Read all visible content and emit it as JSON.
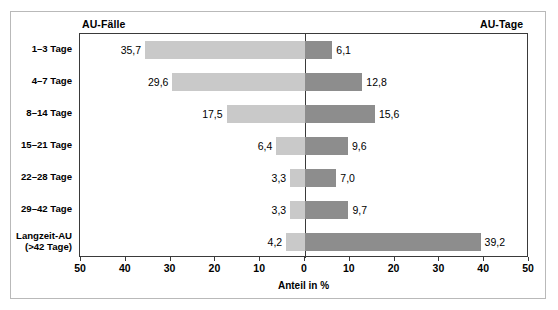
{
  "chart_data": {
    "type": "bar",
    "orientation": "horizontal-diverging",
    "title": "",
    "subtitle": "",
    "xlabel": "Anteil in %",
    "ylabel": "",
    "xlim": [
      -50,
      50
    ],
    "grid": false,
    "legend_position": "top",
    "axis_tick_labels": [
      "50",
      "40",
      "30",
      "20",
      "10",
      "0",
      "10",
      "20",
      "30",
      "40",
      "50"
    ],
    "axis_tick_values": [
      -50,
      -40,
      -30,
      -20,
      -10,
      0,
      10,
      20,
      30,
      40,
      50
    ],
    "panel_left_caption": "AU-Fälle",
    "panel_right_caption": "AU-Tage",
    "categories": [
      "1–3 Tage",
      "4–7 Tage",
      "8–14 Tage",
      "15–21 Tage",
      "22–28 Tage",
      "29–42 Tage",
      "Langzeit-AU\n(>42 Tage)"
    ],
    "series": [
      {
        "name": "AU-Fälle",
        "side": "left",
        "color": "#c9c9c9",
        "values": [
          35.7,
          29.6,
          17.5,
          6.4,
          3.3,
          3.3,
          4.2
        ],
        "labels": [
          "35,7",
          "29,6",
          "17,5",
          "6,4",
          "3,3",
          "3,3",
          "4,2"
        ]
      },
      {
        "name": "AU-Tage",
        "side": "right",
        "color": "#8d8d8d",
        "values": [
          6.1,
          12.8,
          15.6,
          9.6,
          7.0,
          9.7,
          39.2
        ],
        "labels": [
          "6,1",
          "12,8",
          "15,6",
          "9,6",
          "7,0",
          "9,7",
          "39,2"
        ]
      }
    ]
  },
  "colors": {
    "bar_left": "#c9c9c9",
    "bar_right": "#8d8d8d",
    "axis": "#3a3a3a",
    "frame": "#b9b9b9",
    "background": "#ffffff",
    "text": "#000000"
  }
}
